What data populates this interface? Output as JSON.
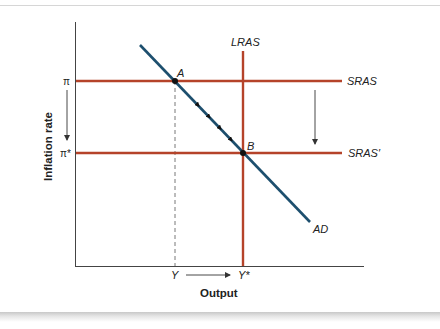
{
  "diagram": {
    "type": "AD-AS model",
    "axes": {
      "x_label": "Output",
      "y_label": "Inflation rate"
    },
    "y_ticks": {
      "pi": "π",
      "pi_star": "π*"
    },
    "x_ticks": {
      "y": "Y",
      "y_star": "Y*"
    },
    "curves": {
      "lras": "LRAS",
      "sras": "SRAS",
      "sras_prime": "SRAS′",
      "ad": "AD"
    },
    "points": {
      "a": "A",
      "b": "B"
    },
    "colors": {
      "supply_curves": "#b5432a",
      "ad_curve": "#1d4f6e",
      "axis": "#444444",
      "arrow": "#333333"
    }
  }
}
